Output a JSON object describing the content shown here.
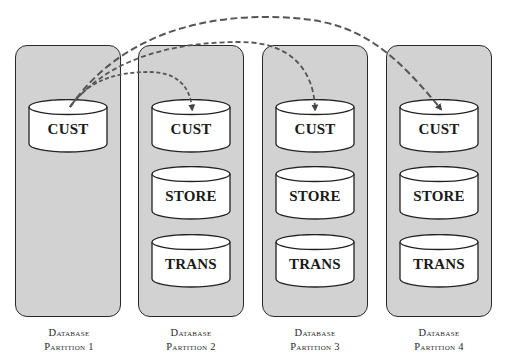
{
  "diagram": {
    "type": "database-partition-replication",
    "partitions": [
      {
        "caption_line1": "Database",
        "caption_line2": "Partition 1",
        "tables": [
          "CUST"
        ]
      },
      {
        "caption_line1": "Database",
        "caption_line2": "Partition 2",
        "tables": [
          "CUST",
          "STORE",
          "TRANS"
        ]
      },
      {
        "caption_line1": "Database",
        "caption_line2": "Partition 3",
        "tables": [
          "CUST",
          "STORE",
          "TRANS"
        ]
      },
      {
        "caption_line1": "Database",
        "caption_line2": "Partition 4",
        "tables": [
          "CUST",
          "STORE",
          "TRANS"
        ]
      }
    ],
    "arrows": [
      {
        "from": "Partition 1 / CUST",
        "to": "Partition 2 / CUST",
        "style": "dashed"
      },
      {
        "from": "Partition 1 / CUST",
        "to": "Partition 3 / CUST",
        "style": "dashed"
      },
      {
        "from": "Partition 1 / CUST",
        "to": "Partition 4 / CUST",
        "style": "dashed"
      }
    ],
    "colors": {
      "partition_fill": "#d2d2d2",
      "partition_border": "#2a2a2a",
      "cylinder_fill": "#ffffff",
      "arrow": "#555555"
    }
  }
}
